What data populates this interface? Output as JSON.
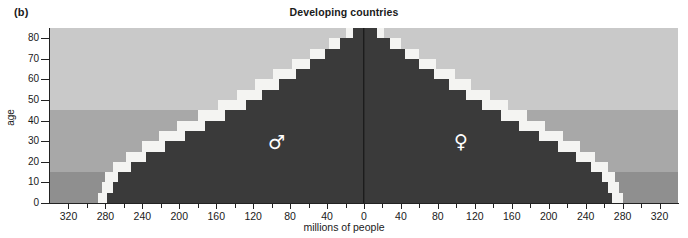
{
  "panel": {
    "label": "(b)"
  },
  "title": "Developing countries",
  "axes": {
    "y_title": "age",
    "x_title": "millions of people",
    "y_ticks": [
      0,
      10,
      20,
      30,
      40,
      50,
      60,
      70,
      80
    ],
    "x_tick_labels": [
      320,
      280,
      240,
      200,
      160,
      120,
      80,
      40,
      0,
      40,
      80,
      120,
      160,
      200,
      240,
      280,
      320
    ]
  },
  "legend": {
    "male_symbol": "♂",
    "female_symbol": "♀"
  },
  "colors": {
    "band_old": "#c9c9c9",
    "band_working": "#a8a8a8",
    "band_young": "#8f8f8f",
    "population_dark": "#3a3a3a",
    "population_light": "#f4f4f2",
    "axis": "#222222",
    "text": "#1a1a1a"
  },
  "chart_data": {
    "type": "bar",
    "subtype": "population-pyramid",
    "title": "Developing countries",
    "xlabel": "millions of people",
    "ylabel": "age",
    "xlim": [
      -340,
      340
    ],
    "ylim": [
      0,
      85
    ],
    "grid": false,
    "legend_position": "in-plot",
    "x_axis_note": "Axis mirrored about centre; values shown are absolute millions on both sides",
    "categories": [
      "0-4",
      "5-9",
      "10-14",
      "15-19",
      "20-24",
      "25-29",
      "30-34",
      "35-39",
      "40-44",
      "45-49",
      "50-54",
      "55-59",
      "60-64",
      "65-69",
      "70-74",
      "75-79",
      "80-84"
    ],
    "background_bands": [
      {
        "name": "young",
        "age_from": 0,
        "age_to": 15,
        "color": "#8f8f8f"
      },
      {
        "name": "working",
        "age_from": 15,
        "age_to": 45,
        "color": "#a8a8a8"
      },
      {
        "name": "older",
        "age_from": 45,
        "age_to": 85,
        "color": "#c9c9c9"
      }
    ],
    "series": [
      {
        "name": "Male (current)",
        "side": "left",
        "color": "#3a3a3a",
        "values": [
          278,
          272,
          266,
          252,
          236,
          216,
          194,
          172,
          150,
          128,
          110,
          92,
          74,
          58,
          42,
          26,
          12
        ]
      },
      {
        "name": "Male (projected)",
        "side": "left",
        "color": "#f4f4f2",
        "values": [
          288,
          284,
          280,
          272,
          258,
          240,
          222,
          202,
          180,
          158,
          138,
          118,
          98,
          78,
          58,
          38,
          20
        ]
      },
      {
        "name": "Female (current)",
        "side": "right",
        "color": "#3a3a3a",
        "values": [
          268,
          264,
          258,
          246,
          230,
          210,
          190,
          168,
          148,
          128,
          110,
          92,
          76,
          60,
          44,
          28,
          14
        ]
      },
      {
        "name": "Female (projected)",
        "side": "right",
        "color": "#f4f4f2",
        "values": [
          280,
          276,
          272,
          264,
          250,
          234,
          216,
          196,
          176,
          156,
          136,
          116,
          98,
          78,
          60,
          40,
          22
        ]
      }
    ]
  }
}
